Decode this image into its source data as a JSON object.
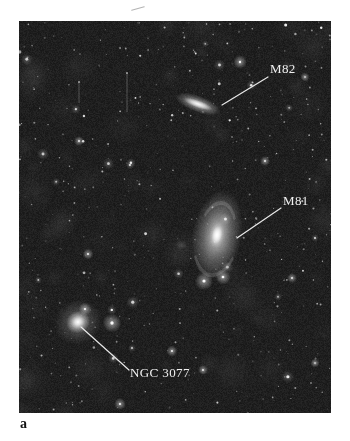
{
  "page": {
    "background": "#ffffff",
    "panel_label": "a"
  },
  "photo": {
    "description": "Wide-field photograph of the M81 group of galaxies on a dark starfield",
    "background_color": "#1d1d1d",
    "label_color": "#f0f0f0",
    "leader_line_color": "#e8e8e8",
    "objects": [
      {
        "id": "m82",
        "name": "M82",
        "type": "edge-on-galaxy",
        "x": 179,
        "y": 83,
        "rx": 20,
        "ry": 7,
        "angle_deg": 20
      },
      {
        "id": "m81",
        "name": "M81",
        "type": "spiral-galaxy",
        "x": 198,
        "y": 214,
        "rx": 25,
        "ry": 45,
        "angle_deg": 10
      },
      {
        "id": "ngc3077",
        "name": "NGC 3077",
        "type": "elliptical-galaxy",
        "x": 59,
        "y": 301,
        "rx": 11,
        "ry": 10,
        "angle_deg": -30
      },
      {
        "id": "faint-patch",
        "name": "",
        "type": "faint-patch",
        "x": 162,
        "y": 224,
        "rx": 6,
        "ry": 5,
        "angle_deg": 0
      }
    ],
    "bright_stars": [
      {
        "x": 221,
        "y": 41,
        "r": 1.5
      },
      {
        "x": 286,
        "y": 56,
        "r": 1.0
      },
      {
        "x": 60,
        "y": 120,
        "r": 1.1
      },
      {
        "x": 246,
        "y": 140,
        "r": 1.1
      },
      {
        "x": 69,
        "y": 233,
        "r": 1.2
      },
      {
        "x": 204,
        "y": 256,
        "r": 1.7
      },
      {
        "x": 185,
        "y": 260,
        "r": 2.0
      },
      {
        "x": 273,
        "y": 257,
        "r": 1.1
      },
      {
        "x": 66,
        "y": 288,
        "r": 1.4
      },
      {
        "x": 93,
        "y": 302,
        "r": 2.1
      },
      {
        "x": 153,
        "y": 330,
        "r": 1.2
      },
      {
        "x": 184,
        "y": 349,
        "r": 1.1
      },
      {
        "x": 296,
        "y": 342,
        "r": 1.0
      },
      {
        "x": 101,
        "y": 383,
        "r": 1.3
      }
    ],
    "annotations": [
      {
        "id": "m82",
        "label": "M82",
        "label_x": 251,
        "label_y": 41,
        "x1": 249,
        "y1": 56,
        "x2": 203,
        "y2": 84
      },
      {
        "id": "m81",
        "label": "M81",
        "label_x": 264,
        "label_y": 173,
        "x1": 262,
        "y1": 187,
        "x2": 218,
        "y2": 217
      },
      {
        "id": "ngc3077",
        "label": "NGC 3077",
        "label_x": 111,
        "label_y": 345,
        "x1": 110,
        "y1": 349,
        "x2": 62,
        "y2": 306
      }
    ],
    "artifact_streaks": [
      {
        "x": 108,
        "y1": 52,
        "y2": 91
      },
      {
        "x": 60,
        "y1": 61,
        "y2": 82
      }
    ]
  }
}
